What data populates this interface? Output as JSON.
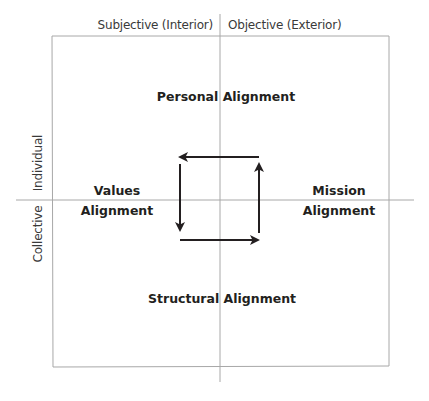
{
  "diagram": {
    "type": "quadrant",
    "axes": {
      "top_left_label": "Subjective (Interior)",
      "top_right_label": "Objective (Exterior)",
      "left_upper_label": "Individual",
      "left_lower_label": "Collective"
    },
    "quadrants": {
      "top": "Personal Alignment",
      "left_line1": "Values",
      "left_line2": "Alignment",
      "right_line1": "Mission",
      "right_line2": "Alignment",
      "bottom": "Structural Alignment"
    },
    "cycle_arrows": [
      "right-to-left (top)",
      "top-to-bottom (left)",
      "left-to-right (bottom)",
      "bottom-to-top (right)"
    ],
    "colors": {
      "line": "#a8a8a8",
      "arrow": "#231f20",
      "text": "#231f20"
    }
  }
}
